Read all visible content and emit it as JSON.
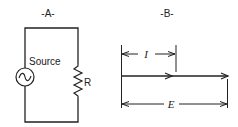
{
  "panel_a": {
    "title": "-A-",
    "source_label": "Source",
    "resistor_label": "R",
    "source_icon": "ac-source-icon",
    "resistor_icon": "resistor-icon"
  },
  "panel_b": {
    "title": "-B-",
    "current_label": "I",
    "voltage_label": "E",
    "description": "In-phase current and voltage phasors"
  },
  "colors": {
    "line": "#222222",
    "background": "#ffffff"
  }
}
